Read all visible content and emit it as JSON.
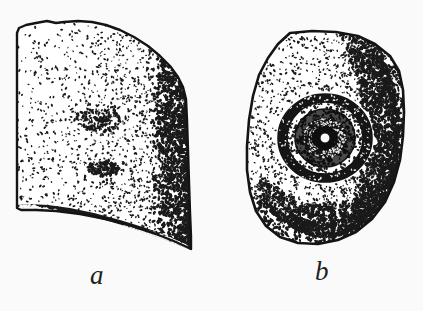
{
  "plate": {
    "background_color": "#fafafa",
    "ink_color": "#1a1a1a",
    "width": 423,
    "height": 311,
    "medium": "stippled pen-and-ink line drawing",
    "subject": "two views of an artifact specimen"
  },
  "figures": [
    {
      "id": "a",
      "caption": "a",
      "description": "side view of specimen, trapezoidal slab with irregular top edge, dark shading along right margin and heavy textured band along the sloping broken base",
      "outline": "M 17,33 L 19,28 L 26,25 L 36,23 L 47,21 L 56,23 L 64,22 L 78,21 L 92,22 L 106,25 L 120,30 L 134,37 L 148,46 L 160,56 L 170,66 L 178,77 L 183,87 L 186,99 L 187,120 L 188,150 L 189,182 L 190,212 L 191,236 L 191,249 L 176,242 L 156,234 L 132,226 L 106,219 L 80,214 L 56,211 L 36,210 L 21,210 L 17,208 Z",
      "base_band": "M 17,205 L 30,204 L 48,205 L 70,208 L 94,213 L 120,220 L 146,228 L 170,237 L 191,247 L 191,250 L 166,240 L 140,231 L 112,222 L 84,215 L 56,211 L 32,209 L 17,209 Z",
      "bbox": [
        16,
        20,
        192,
        251
      ]
    },
    {
      "id": "b",
      "caption": "b",
      "description": "end-on view of specimen, rounded squarish outline with a concentric ringed socket depression left of centre, dense shading on right and lower margins",
      "outline": "M 290,33 L 312,31 L 336,32 L 358,36 L 375,44 L 390,56 L 399,71 L 403,90 L 404,112 L 403,136 L 400,160 L 394,182 L 385,202 L 372,219 L 356,232 L 338,240 L 318,244 L 298,243 L 280,237 L 266,226 L 256,211 L 250,192 L 247,170 L 247,146 L 249,120 L 253,96 L 259,75 L 268,58 L 278,44 Z",
      "socket": {
        "center": [
          325,
          138
        ],
        "rings": [
          {
            "rx": 47,
            "ry": 44,
            "tone": "dark",
            "label": "outer dark rim"
          },
          {
            "rx": 38,
            "ry": 36,
            "tone": "light",
            "label": "light terrace"
          },
          {
            "rx": 30,
            "ry": 29,
            "tone": "mid",
            "label": "inner terrace"
          },
          {
            "rx": 21,
            "ry": 20,
            "tone": "dark",
            "label": "inner dark bowl"
          },
          {
            "rx": 12,
            "ry": 11,
            "tone": "mid",
            "label": "hollow wall"
          },
          {
            "rx": 5,
            "ry": 5,
            "tone": "white",
            "label": "central perforation"
          }
        ]
      },
      "bbox": [
        246,
        30,
        405,
        245
      ]
    }
  ],
  "captions": {
    "a": "a",
    "b": "b"
  }
}
